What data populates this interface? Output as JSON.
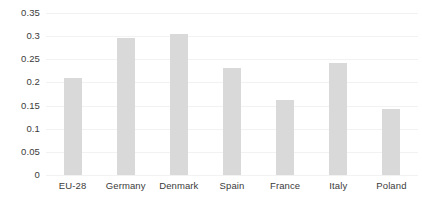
{
  "chart_data": {
    "type": "bar",
    "title": "",
    "subtitle": "",
    "xlabel": "",
    "ylabel": "",
    "categories": [
      "EU-28",
      "Germany",
      "Denmark",
      "Spain",
      "France",
      "Italy",
      "Poland"
    ],
    "values": [
      0.21,
      0.295,
      0.305,
      0.232,
      0.162,
      0.243,
      0.143
    ],
    "series": [
      {
        "name": "",
        "values": [
          0.21,
          0.295,
          0.305,
          0.232,
          0.162,
          0.243,
          0.143
        ]
      }
    ],
    "ylim": [
      0,
      0.35
    ],
    "ytick_labels": [
      "0.35",
      "0.3",
      "0.25",
      "0.2",
      "0.15",
      "0.1",
      "0.05",
      "0"
    ],
    "ytick_values": [
      0.35,
      0.3,
      0.25,
      0.2,
      0.15,
      0.1,
      0.05,
      0
    ],
    "grid": true,
    "grid_axis": "y",
    "legend": false,
    "legend_position": "none",
    "bar_color": "#d9d9d9",
    "gridline_color": "#f2f2f2",
    "text_color": "#3b3b3b",
    "background_color": "#ffffff",
    "annotations": []
  }
}
